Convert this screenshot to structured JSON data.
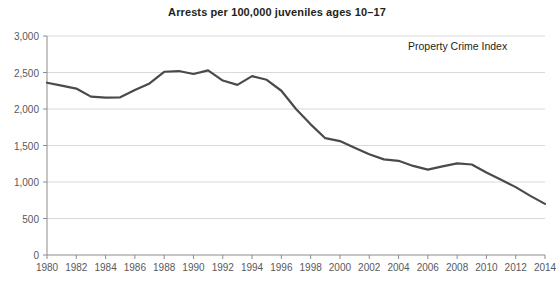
{
  "chart_data": {
    "type": "line",
    "title": "Arrests per 100,000 juveniles ages 10–17",
    "xlabel": "",
    "ylabel": "",
    "xlim": [
      1980,
      2014
    ],
    "ylim": [
      0,
      3000
    ],
    "grid": true,
    "legend_position": "inside-top-right",
    "annotation": "Property Crime Index",
    "line_color": "#4a4a4a",
    "grid_color": "#d9d9d9",
    "axis_color": "#8c8c8c",
    "y_ticks": [
      0,
      500,
      1000,
      1500,
      2000,
      2500,
      3000
    ],
    "y_tick_labels": [
      "0",
      "500",
      "1,000",
      "1,500",
      "2,000",
      "2,500",
      "3,000"
    ],
    "x_ticks": [
      1980,
      1982,
      1984,
      1986,
      1988,
      1990,
      1992,
      1994,
      1996,
      1998,
      2000,
      2002,
      2004,
      2006,
      2008,
      2010,
      2012,
      2014
    ],
    "x_tick_labels": [
      "1980",
      "1982",
      "1984",
      "1986",
      "1988",
      "1990",
      "1992",
      "1994",
      "1996",
      "1998",
      "2000",
      "2002",
      "2004",
      "2006",
      "2008",
      "2010",
      "2012",
      "2014"
    ],
    "series": [
      {
        "name": "Property Crime Index",
        "x": [
          1980,
          1981,
          1982,
          1983,
          1984,
          1985,
          1986,
          1987,
          1988,
          1989,
          1990,
          1991,
          1992,
          1993,
          1994,
          1995,
          1996,
          1997,
          1998,
          1999,
          2000,
          2001,
          2002,
          2003,
          2004,
          2005,
          2006,
          2007,
          2008,
          2009,
          2010,
          2011,
          2012,
          2013,
          2014
        ],
        "values": [
          2360,
          2320,
          2280,
          2170,
          2155,
          2160,
          2260,
          2350,
          2510,
          2520,
          2480,
          2530,
          2390,
          2330,
          2450,
          2400,
          2250,
          2000,
          1790,
          1600,
          1560,
          1470,
          1380,
          1310,
          1290,
          1220,
          1170,
          1215,
          1255,
          1240,
          1130,
          1030,
          930,
          810,
          700
        ]
      }
    ]
  }
}
